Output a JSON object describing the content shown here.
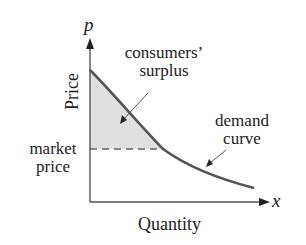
{
  "diagram": {
    "axes": {
      "y_symbol": "p",
      "x_symbol": "x",
      "y_label": "Price",
      "x_label": "Quantity"
    },
    "annotations": {
      "consumers_surplus_line1": "consumers’",
      "consumers_surplus_line2": "surplus",
      "demand_curve_line1": "demand",
      "demand_curve_line2": "curve",
      "market_price_line1": "market",
      "market_price_line2": "price"
    },
    "colors": {
      "curve": "#555555",
      "axis": "#555555",
      "shading": "#e0e0e0",
      "dashed": "#666666",
      "text": "#222222"
    }
  }
}
